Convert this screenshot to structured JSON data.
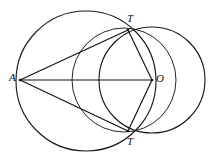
{
  "figure": {
    "background_color": "#ffffff",
    "stroke_color": "#111111",
    "width": 214,
    "height": 159,
    "faint_top_text": "",
    "points": [
      {
        "id": "A",
        "label": "A",
        "x": 20,
        "y": 80,
        "label_dx": -11,
        "label_dy": -6
      },
      {
        "id": "T",
        "label": "T",
        "x": 128,
        "y": 30,
        "label_dx": -1,
        "label_dy": -15
      },
      {
        "id": "Tp",
        "label": "T",
        "x": 128,
        "y": 131,
        "label_dx": -1,
        "label_dy": 5
      },
      {
        "id": "O",
        "label": "O",
        "x": 152,
        "y": 80,
        "label_dx": 4,
        "label_dy": -6
      }
    ],
    "circles": [
      {
        "id": "big-circle",
        "name": "large-circle-through-A-T-Tprime",
        "cx": 86,
        "cy": 81,
        "r": 70
      },
      {
        "id": "right-circle",
        "name": "circle-centered-at-O",
        "cx": 152,
        "cy": 80,
        "r": 53
      },
      {
        "id": "mid-circle",
        "name": "circle-on-diameter-T-Tprime-through-O",
        "cx": 124,
        "cy": 80,
        "r": 52
      }
    ],
    "segments": [
      {
        "id": "A-T",
        "name": "segment-A-to-T",
        "x1": 20,
        "y1": 80,
        "x2": 128,
        "y2": 30
      },
      {
        "id": "A-Tp",
        "name": "segment-A-to-Tprime",
        "x1": 20,
        "y1": 80,
        "x2": 128,
        "y2": 131
      },
      {
        "id": "A-O",
        "name": "segment-A-to-O",
        "x1": 20,
        "y1": 80,
        "x2": 152,
        "y2": 80
      },
      {
        "id": "T-O",
        "name": "segment-T-to-O",
        "x1": 128,
        "y1": 30,
        "x2": 152,
        "y2": 80
      },
      {
        "id": "Tp-O",
        "name": "segment-Tprime-to-O",
        "x1": 128,
        "y1": 131,
        "x2": 152,
        "y2": 80
      }
    ]
  }
}
